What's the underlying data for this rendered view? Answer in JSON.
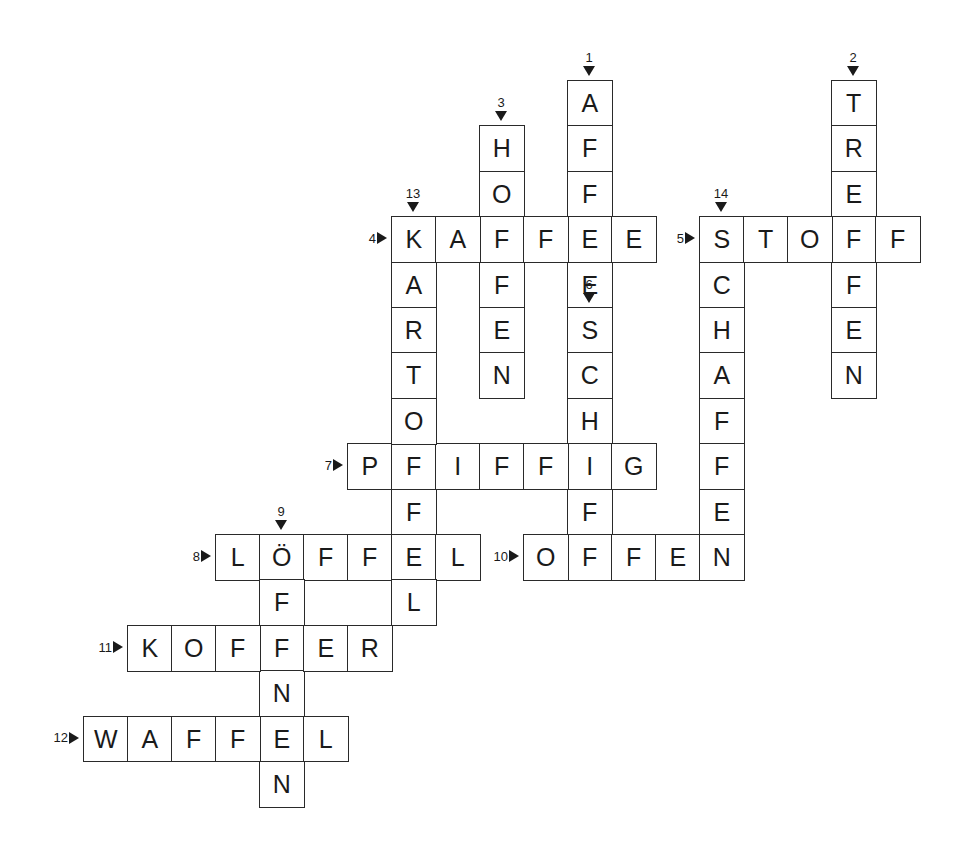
{
  "grid": {
    "origin_x": 83,
    "origin_y": 80,
    "cell_w": 44,
    "cell_h": 45.4
  },
  "words": [
    {
      "number": "1",
      "direction": "down",
      "row": 0,
      "col": 11,
      "answer": "AFFEE"
    },
    {
      "number": "2",
      "direction": "down",
      "row": 0,
      "col": 17,
      "answer": "TREFFEN"
    },
    {
      "number": "3",
      "direction": "down",
      "row": 1,
      "col": 9,
      "answer": "HOFFEN"
    },
    {
      "number": "4",
      "direction": "across",
      "row": 3,
      "col": 7,
      "answer": "KAFFEE"
    },
    {
      "number": "5",
      "direction": "across",
      "row": 3,
      "col": 14,
      "answer": "STOFF"
    },
    {
      "number": "6",
      "direction": "down",
      "row": 5,
      "col": 11,
      "answer": "SCHIFF"
    },
    {
      "number": "7",
      "direction": "across",
      "row": 8,
      "col": 6,
      "answer": "PFIFFIG"
    },
    {
      "number": "8",
      "direction": "across",
      "row": 10,
      "col": 3,
      "answer": "LÖFFEL"
    },
    {
      "number": "9",
      "direction": "down",
      "row": 10,
      "col": 4,
      "answer": "ÖFFNEN"
    },
    {
      "number": "10",
      "direction": "across",
      "row": 10,
      "col": 10,
      "answer": "OFFEN"
    },
    {
      "number": "11",
      "direction": "across",
      "row": 12,
      "col": 1,
      "answer": "KOFFER"
    },
    {
      "number": "12",
      "direction": "across",
      "row": 14,
      "col": 0,
      "answer": "WAFFEL"
    },
    {
      "number": "13",
      "direction": "down",
      "row": 3,
      "col": 7,
      "answer": "KARTOFFEL"
    },
    {
      "number": "14",
      "direction": "down",
      "row": 3,
      "col": 14,
      "answer": "SCHAFFEN"
    }
  ]
}
